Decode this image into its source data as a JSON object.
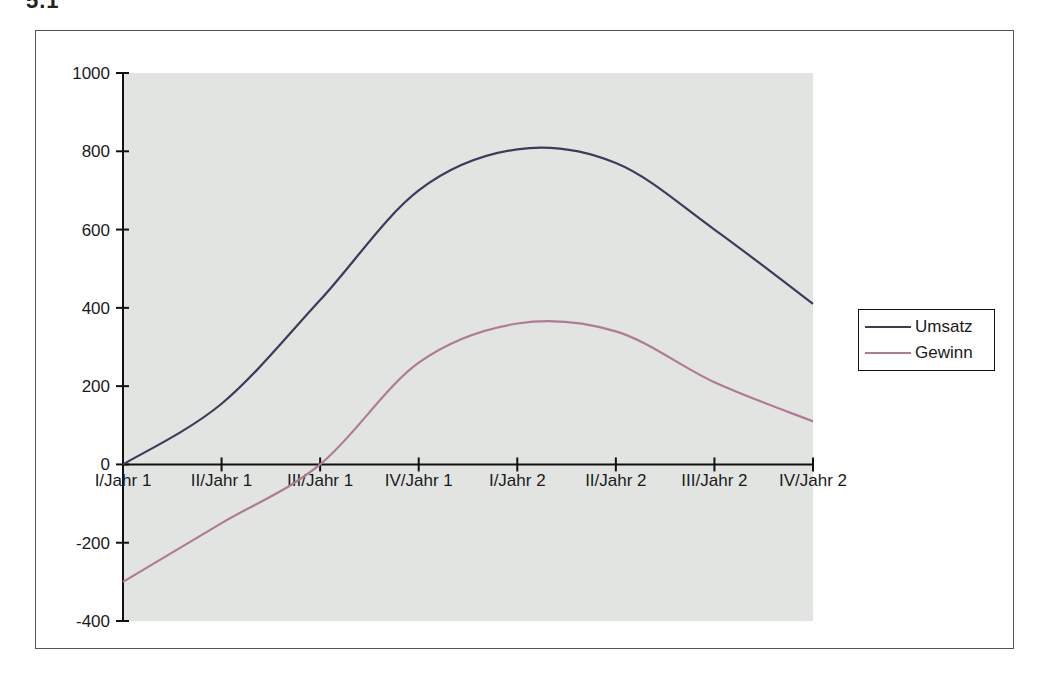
{
  "page": {
    "heading_fragment": "5.1"
  },
  "chart_data": {
    "type": "line",
    "title": "",
    "xlabel": "",
    "ylabel": "",
    "categories": [
      "I/Jahr 1",
      "II/Jahr 1",
      "III/Jahr 1",
      "IV/Jahr 1",
      "I/Jahr 2",
      "II/Jahr 2",
      "III/Jahr 2",
      "IV/Jahr 2"
    ],
    "series": [
      {
        "name": "Umsatz",
        "color": "#3d3a5c",
        "values": [
          0,
          155,
          420,
          700,
          805,
          770,
          600,
          410
        ]
      },
      {
        "name": "Gewinn",
        "color": "#b07a95",
        "values": [
          -300,
          -150,
          0,
          260,
          360,
          340,
          210,
          110
        ]
      }
    ],
    "ylim": [
      -400,
      1000
    ],
    "yticks": [
      1000,
      800,
      600,
      400,
      200,
      0,
      -200,
      -400
    ],
    "smooth": true,
    "grid": false,
    "plot_background": "#e2e4e2",
    "legend_position": "right"
  },
  "legend": {
    "items": [
      {
        "label": "Umsatz",
        "color": "#3d3a5c"
      },
      {
        "label": "Gewinn",
        "color": "#b07a95"
      }
    ]
  }
}
